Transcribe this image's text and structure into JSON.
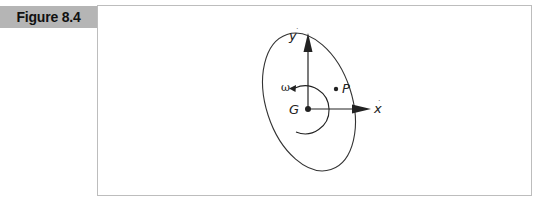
{
  "figure": {
    "label": "Figure 8.4"
  },
  "diagram": {
    "labels": {
      "y_axis": "y",
      "x_axis": "x",
      "center": "G",
      "point": "P",
      "angular_velocity": "ω"
    },
    "colors": {
      "tag_background": "#b5b5b5",
      "frame_border": "#bdbdbd",
      "stroke": "#222222"
    }
  }
}
